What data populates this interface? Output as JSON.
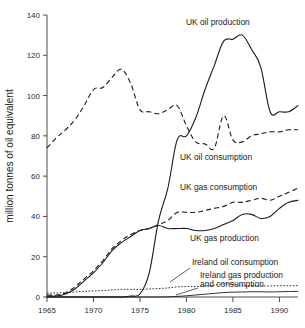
{
  "chart_data": {
    "type": "line",
    "title": "",
    "subtitle": "",
    "xlabel": "",
    "ylabel": "million tonnes of oil equivalent",
    "xlim": [
      1965,
      1992
    ],
    "ylim": [
      0,
      140
    ],
    "grid": false,
    "legend_position": "inline-annotations",
    "xticks": [
      "1965",
      "1970",
      "1975",
      "1980",
      "1985",
      "1990"
    ],
    "xtick_values": [
      1965,
      1970,
      1975,
      1980,
      1985,
      1990
    ],
    "yticks": [
      "0",
      "20",
      "40",
      "60",
      "80",
      "100",
      "120",
      "140"
    ],
    "ytick_values": [
      0,
      20,
      40,
      60,
      80,
      100,
      120,
      140
    ],
    "x": [
      1965,
      1966,
      1967,
      1968,
      1969,
      1970,
      1971,
      1972,
      1973,
      1974,
      1975,
      1976,
      1977,
      1978,
      1979,
      1980,
      1981,
      1982,
      1983,
      1984,
      1985,
      1986,
      1987,
      1988,
      1989,
      1990,
      1991,
      1992
    ],
    "series": [
      {
        "name": "UK oil consumption",
        "style": "dashed",
        "values": [
          74,
          79,
          83,
          88,
          95,
          103,
          104,
          109,
          113,
          106,
          93,
          92,
          91,
          93,
          95,
          85,
          77,
          76,
          74,
          90,
          78,
          77,
          80,
          81,
          82,
          82,
          83,
          83
        ]
      },
      {
        "name": "UK oil production",
        "style": "solid",
        "values": [
          0,
          0,
          0,
          0,
          0,
          0,
          0,
          0,
          0,
          0.5,
          1.5,
          12,
          38,
          54,
          78,
          80,
          89,
          103,
          115,
          127,
          128,
          130,
          123,
          114,
          92,
          92,
          92,
          95
        ]
      },
      {
        "name": "UK gas consumption",
        "style": "dashed",
        "values": [
          1,
          1,
          2,
          5,
          9,
          13,
          18,
          24,
          28,
          31,
          33,
          34,
          36,
          38,
          42,
          42,
          42,
          43,
          44,
          45,
          47,
          47,
          48,
          49,
          48,
          50,
          52,
          54
        ]
      },
      {
        "name": "UK gas production",
        "style": "solid",
        "values": [
          0.5,
          0.5,
          1.5,
          4,
          8,
          12,
          17,
          23,
          27,
          30,
          33,
          34,
          35.5,
          34,
          34,
          34,
          33,
          33,
          34,
          36,
          38,
          41,
          41,
          39,
          40,
          44,
          47,
          48
        ]
      },
      {
        "name": "Ireland oil consumption",
        "style": "dotted",
        "values": [
          2,
          2,
          2.2,
          2.5,
          2.8,
          3,
          3.2,
          3.5,
          3.8,
          3.8,
          3.8,
          4,
          4.2,
          4.5,
          5,
          5.2,
          5.2,
          5.5,
          5.8,
          6.5,
          6.3,
          5.8,
          5.6,
          5.5,
          5.5,
          5.6,
          5.6,
          5.6
        ]
      },
      {
        "name": "Ireland gas production and consumption",
        "style": "thin",
        "values": [
          0,
          0,
          0,
          0,
          0,
          0,
          0,
          0,
          0,
          0,
          0,
          0,
          0,
          0.1,
          0.3,
          0.6,
          1,
          1.4,
          1.8,
          2.2,
          2.4,
          2.5,
          2.6,
          2.6,
          2.5,
          2.6,
          2.7,
          2.8
        ]
      }
    ],
    "annotations": [
      {
        "text": "UK oil production",
        "x": 186,
        "y": 25
      },
      {
        "text": "UK oil consumption",
        "x": 180,
        "y": 160
      },
      {
        "text": "UK gas consumption",
        "x": 180,
        "y": 190
      },
      {
        "text": "UK gas production",
        "x": 190,
        "y": 241
      },
      {
        "text": "Ireland oil consumption",
        "x": 192,
        "y": 265
      },
      {
        "text": "Ireland gas production",
        "x": 200,
        "y": 278
      },
      {
        "text": "and consumption",
        "x": 200,
        "y": 287
      }
    ],
    "colors": {
      "line": "#1a1a1a",
      "axis": "#4a4a4a",
      "background": "#ffffff",
      "text": "#1a1a1a"
    }
  }
}
